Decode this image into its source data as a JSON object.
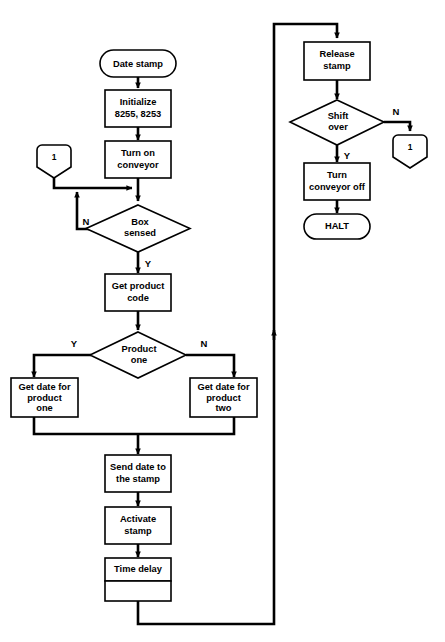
{
  "diagram": {
    "type": "flowchart",
    "stroke_color": "#000000",
    "fill_color": "#ffffff",
    "background": "#ffffff"
  },
  "nodes": {
    "start": {
      "label": "Date stamp",
      "shape": "terminator"
    },
    "initialize": {
      "line1": "Initialize",
      "line2": "8255, 8253",
      "shape": "process"
    },
    "turn_on_conveyor": {
      "line1": "Turn on",
      "line2": "conveyor",
      "shape": "process"
    },
    "connector_left": {
      "label": "1",
      "shape": "connector"
    },
    "box_sensed": {
      "line1": "Box",
      "line2": "sensed",
      "shape": "decision"
    },
    "get_product_code": {
      "line1": "Get product",
      "line2": "code",
      "shape": "process"
    },
    "product_one": {
      "line1": "Product",
      "line2": "one",
      "shape": "decision"
    },
    "get_date_product_one": {
      "line1": "Get date for",
      "line2": "product",
      "line3": "one",
      "shape": "process"
    },
    "get_date_product_two": {
      "line1": "Get date for",
      "line2": "product",
      "line3": "two",
      "shape": "process"
    },
    "send_date": {
      "line1": "Send date to",
      "line2": "the stamp",
      "shape": "process"
    },
    "activate_stamp": {
      "line1": "Activate",
      "line2": "stamp",
      "shape": "process"
    },
    "time_delay": {
      "line1": "Time delay",
      "shape": "process"
    },
    "blank_box": {
      "line1": "",
      "shape": "process"
    },
    "release_stamp": {
      "line1": "Release",
      "line2": "stamp",
      "shape": "process"
    },
    "shift_over": {
      "line1": "Shift",
      "line2": "over",
      "shape": "decision"
    },
    "connector_right": {
      "label": "1",
      "shape": "connector"
    },
    "turn_conveyor_off": {
      "line1": "Turn",
      "line2": "conveyor off",
      "shape": "process"
    },
    "halt": {
      "label": "HALT",
      "shape": "terminator"
    }
  },
  "branch_labels": {
    "box_sensed_no": "N",
    "box_sensed_yes": "Y",
    "product_one_yes": "Y",
    "product_one_no": "N",
    "shift_over_no": "N",
    "shift_over_yes": "Y"
  }
}
